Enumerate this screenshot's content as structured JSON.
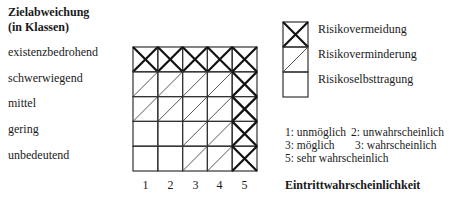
{
  "y_axis": {
    "title_line1": "Zielabweichung",
    "title_line2": "(in Klassen)",
    "rows": [
      "existenzbedrohend",
      "schwerwiegend",
      "mittel",
      "gering",
      "unbedeutend"
    ]
  },
  "x_axis": {
    "columns": [
      "1",
      "2",
      "3",
      "4",
      "5"
    ],
    "title": "Eintrittwahrscheinlichkeit"
  },
  "matrix": [
    [
      "X",
      "X",
      "X",
      "X",
      "X"
    ],
    [
      "/",
      "/",
      "/",
      "/",
      "X"
    ],
    [
      "/",
      "/",
      "/",
      "/",
      "X"
    ],
    [
      "",
      "",
      "/",
      "/",
      "X"
    ],
    [
      "",
      "",
      "/",
      "/",
      "X"
    ]
  ],
  "legend": {
    "items": [
      {
        "symbol": "X",
        "label": "Risikovermeidung"
      },
      {
        "symbol": "/",
        "label": "Risikoverminderung"
      },
      {
        "symbol": "",
        "label": "Risikoselbsttragung"
      }
    ]
  },
  "scale_notes": {
    "line1_a": "1: unmöglich",
    "line1_b": "2: unwahrscheinlich",
    "line2_a": "3: möglich",
    "line2_b": "3: wahrscheinlich",
    "line3": "5: sehr wahrscheinlich"
  },
  "chart_data": {
    "type": "heatmap",
    "title": "",
    "xlabel": "Eintrittwahrscheinlichkeit",
    "ylabel": "Zielabweichung (in Klassen)",
    "x_categories": [
      "1",
      "2",
      "3",
      "4",
      "5"
    ],
    "y_categories": [
      "existenzbedrohend",
      "schwerwiegend",
      "mittel",
      "gering",
      "unbedeutend"
    ],
    "values": [
      [
        "Risikovermeidung",
        "Risikovermeidung",
        "Risikovermeidung",
        "Risikovermeidung",
        "Risikovermeidung"
      ],
      [
        "Risikoverminderung",
        "Risikoverminderung",
        "Risikoverminderung",
        "Risikoverminderung",
        "Risikovermeidung"
      ],
      [
        "Risikoverminderung",
        "Risikoverminderung",
        "Risikoverminderung",
        "Risikoverminderung",
        "Risikovermeidung"
      ],
      [
        "Risikoselbsttragung",
        "Risikoselbsttragung",
        "Risikoverminderung",
        "Risikoverminderung",
        "Risikovermeidung"
      ],
      [
        "Risikoselbsttragung",
        "Risikoselbsttragung",
        "Risikoverminderung",
        "Risikoverminderung",
        "Risikovermeidung"
      ]
    ],
    "legend": [
      "Risikovermeidung",
      "Risikoverminderung",
      "Risikoselbsttragung"
    ],
    "legend_position": "right"
  }
}
